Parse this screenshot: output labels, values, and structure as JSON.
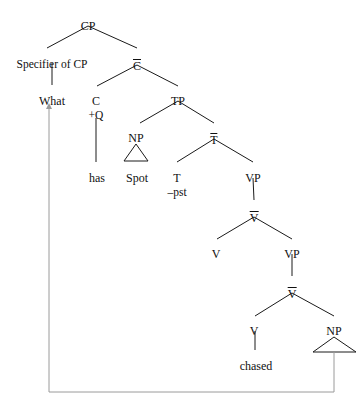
{
  "diagram": {
    "kind": "syntax-tree",
    "title": "",
    "nodes": [
      {
        "id": "cp",
        "label": "CP",
        "x": 88,
        "y": 20,
        "bar": false
      },
      {
        "id": "spec-cp",
        "label": "Specifier of CP",
        "x": 52,
        "y": 58,
        "bar": false
      },
      {
        "id": "cbar",
        "label": "C",
        "x": 137,
        "y": 58,
        "bar": true
      },
      {
        "id": "what",
        "label": "What",
        "x": 52,
        "y": 95,
        "bar": false
      },
      {
        "id": "c",
        "label": "C",
        "x": 96,
        "y": 95,
        "bar": false
      },
      {
        "id": "tp",
        "label": "TP",
        "x": 178,
        "y": 95,
        "bar": false
      },
      {
        "id": "np-spot",
        "label": "NP",
        "x": 136,
        "y": 132,
        "bar": false
      },
      {
        "id": "tbar",
        "label": "T",
        "x": 214,
        "y": 132,
        "bar": true
      },
      {
        "id": "has",
        "label": "has",
        "x": 97,
        "y": 172,
        "bar": false
      },
      {
        "id": "spot",
        "label": "Spot",
        "x": 137,
        "y": 172,
        "bar": false
      },
      {
        "id": "t",
        "label": "T",
        "x": 177,
        "y": 172,
        "bar": false
      },
      {
        "id": "vp1",
        "label": "VP",
        "x": 253,
        "y": 172,
        "bar": false
      },
      {
        "id": "vbar1",
        "label": "V",
        "x": 254,
        "y": 210,
        "bar": true
      },
      {
        "id": "v1",
        "label": "V",
        "x": 216,
        "y": 248,
        "bar": false
      },
      {
        "id": "vp2",
        "label": "VP",
        "x": 292,
        "y": 248,
        "bar": false
      },
      {
        "id": "vbar2",
        "label": "V",
        "x": 292,
        "y": 286,
        "bar": true
      },
      {
        "id": "v2",
        "label": "V",
        "x": 254,
        "y": 325,
        "bar": false
      },
      {
        "id": "np-trace",
        "label": "NP",
        "x": 334,
        "y": 325,
        "bar": false
      },
      {
        "id": "chased",
        "label": "chased",
        "x": 256,
        "y": 360,
        "bar": false
      }
    ],
    "sub_labels": [
      {
        "id": "plus-q",
        "label": "+Q",
        "x": 96,
        "y": 110
      },
      {
        "id": "minus-pst",
        "label": "–pst",
        "x": 177,
        "y": 187
      }
    ],
    "triangles": [
      {
        "id": "np-spot-triangle",
        "apex_x": 136,
        "apex_y": 144,
        "left_x": 124,
        "right_x": 148,
        "base_y": 161
      },
      {
        "id": "np-trace-triangle",
        "apex_x": 334,
        "apex_y": 337,
        "left_x": 313,
        "right_x": 356,
        "base_y": 352
      }
    ],
    "branches": [
      {
        "id": "cp-to-spec",
        "x1": 88,
        "y1": 26,
        "x2": 47,
        "y2": 48
      },
      {
        "id": "cp-to-cbar",
        "x1": 88,
        "y1": 26,
        "x2": 137,
        "y2": 48
      },
      {
        "id": "spec-to-what",
        "x1": 52,
        "y1": 63,
        "x2": 52,
        "y2": 85
      },
      {
        "id": "cbar-to-c",
        "x1": 137,
        "y1": 65,
        "x2": 97,
        "y2": 86
      },
      {
        "id": "cbar-to-tp",
        "x1": 137,
        "y1": 65,
        "x2": 178,
        "y2": 86
      },
      {
        "id": "c-to-has",
        "x1": 96,
        "y1": 118,
        "x2": 96,
        "y2": 162
      },
      {
        "id": "tp-to-np",
        "x1": 178,
        "y1": 101,
        "x2": 140,
        "y2": 123
      },
      {
        "id": "tp-to-tbar",
        "x1": 178,
        "y1": 101,
        "x2": 214,
        "y2": 123
      },
      {
        "id": "tbar-to-t",
        "x1": 214,
        "y1": 139,
        "x2": 177,
        "y2": 162
      },
      {
        "id": "tbar-to-vp1",
        "x1": 214,
        "y1": 139,
        "x2": 253,
        "y2": 162
      },
      {
        "id": "vp1-to-vbar1",
        "x1": 253,
        "y1": 178,
        "x2": 254,
        "y2": 200
      },
      {
        "id": "vbar1-to-v1",
        "x1": 254,
        "y1": 217,
        "x2": 217,
        "y2": 239
      },
      {
        "id": "vbar1-to-vp2",
        "x1": 254,
        "y1": 217,
        "x2": 292,
        "y2": 239
      },
      {
        "id": "vp2-to-vbar2",
        "x1": 292,
        "y1": 254,
        "x2": 292,
        "y2": 276
      },
      {
        "id": "vbar2-to-v2",
        "x1": 292,
        "y1": 293,
        "x2": 255,
        "y2": 316
      },
      {
        "id": "vbar2-to-nptrace",
        "x1": 292,
        "y1": 293,
        "x2": 334,
        "y2": 316
      },
      {
        "id": "v2-to-chased",
        "x1": 255,
        "y1": 331,
        "x2": 255,
        "y2": 350
      }
    ],
    "movement_arrow": {
      "id": "wh-movement-arrow",
      "from": "np-trace",
      "to": "what",
      "path": "M 334 352 L 334 392 L 49 392 L 49 107",
      "arrowhead_x": 49,
      "arrowhead_y": 103,
      "color": "#9a9a9a"
    }
  }
}
